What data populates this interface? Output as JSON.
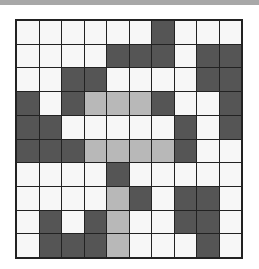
{
  "header": {
    "title": ""
  },
  "board": {
    "rows": 10,
    "cols": 10,
    "colors": {
      "W": "#f7f7f7",
      "D": "#555555",
      "L": "#b8b8b8"
    },
    "cells": [
      [
        "W",
        "W",
        "W",
        "W",
        "W",
        "W",
        "D",
        "W",
        "W",
        "W"
      ],
      [
        "W",
        "W",
        "W",
        "W",
        "D",
        "D",
        "D",
        "W",
        "D",
        "D"
      ],
      [
        "W",
        "W",
        "D",
        "D",
        "W",
        "W",
        "W",
        "W",
        "D",
        "D"
      ],
      [
        "D",
        "W",
        "D",
        "L",
        "L",
        "L",
        "D",
        "W",
        "W",
        "D"
      ],
      [
        "D",
        "D",
        "W",
        "W",
        "W",
        "W",
        "W",
        "D",
        "W",
        "D"
      ],
      [
        "D",
        "D",
        "D",
        "L",
        "L",
        "L",
        "L",
        "D",
        "W",
        "W"
      ],
      [
        "W",
        "W",
        "W",
        "W",
        "D",
        "W",
        "W",
        "W",
        "W",
        "W"
      ],
      [
        "W",
        "W",
        "W",
        "W",
        "L",
        "D",
        "W",
        "D",
        "D",
        "W"
      ],
      [
        "W",
        "D",
        "W",
        "D",
        "L",
        "W",
        "W",
        "D",
        "D",
        "W"
      ],
      [
        "W",
        "D",
        "D",
        "D",
        "L",
        "W",
        "W",
        "W",
        "D",
        "W"
      ]
    ]
  }
}
